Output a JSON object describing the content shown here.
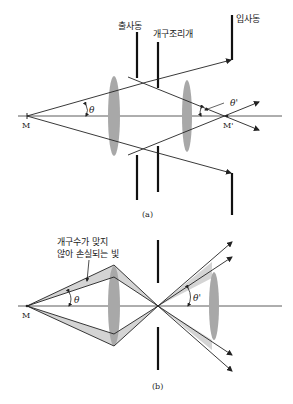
{
  "figure_a": {
    "caption": "(a)",
    "labels": {
      "exit_pupil": "출사동",
      "aperture_stop": "개구조리개",
      "entrance_pupil": "입사동",
      "object_point": "M",
      "image_point": "M'",
      "angle_object": "θ",
      "angle_image": "θ'"
    }
  },
  "figure_b": {
    "caption": "(b)",
    "labels": {
      "lost_light_line1": "개구수가 맞지",
      "lost_light_line2": "않아 손실되는 빛",
      "object_point": "M",
      "angle_object": "θ",
      "angle_image": "θ'"
    }
  },
  "colors": {
    "line": "#222222",
    "lens": "#a8a8a8",
    "lost_light": "#d4d4d4",
    "background": "#ffffff"
  }
}
